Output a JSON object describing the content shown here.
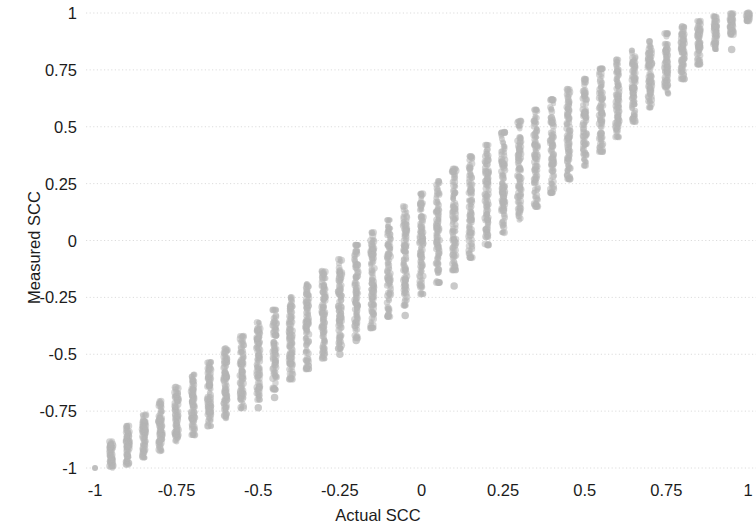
{
  "chart_data": {
    "type": "scatter",
    "title": "",
    "xlabel": "Actual SCC",
    "ylabel": "Measured SCC",
    "xlim": [
      -1.0,
      1.0
    ],
    "ylim": [
      -1.0,
      1.0
    ],
    "grid": true,
    "grid_axis": "y",
    "legend": "none",
    "xticks": [
      -1,
      -0.75,
      -0.5,
      -0.25,
      0,
      0.25,
      0.5,
      0.75,
      1
    ],
    "xticklabels": [
      "-1",
      "-0.75",
      "-0.5",
      "-0.25",
      "0",
      "0.25",
      "0.5",
      "0.75",
      "1"
    ],
    "yticks": [
      -1,
      -0.75,
      -0.5,
      -0.25,
      0,
      0.25,
      0.5,
      0.75,
      1
    ],
    "yticklabels": [
      "-1",
      "-0.75",
      "-0.5",
      "-0.25",
      "0",
      "0.25",
      "0.5",
      "0.75",
      "1"
    ],
    "marker": {
      "shape": "circle",
      "color": "#b4b4b4",
      "size_px": 3.0,
      "opacity": 0.55
    },
    "series": [
      {
        "name": "Measured vs Actual SCC",
        "columns": [
          {
            "x": -1.0,
            "n": 1,
            "center": -1.0,
            "lo": -1.0,
            "hi": -1.0
          },
          {
            "x": -0.95,
            "n": 60,
            "center": -0.94,
            "lo": -1.0,
            "hi": -0.875
          },
          {
            "x": -0.9,
            "n": 70,
            "center": -0.9,
            "lo": -0.985,
            "hi": -0.815
          },
          {
            "x": -0.85,
            "n": 75,
            "center": -0.855,
            "lo": -0.955,
            "hi": -0.765
          },
          {
            "x": -0.8,
            "n": 80,
            "center": -0.81,
            "lo": -0.925,
            "hi": -0.705
          },
          {
            "x": -0.75,
            "n": 85,
            "center": -0.76,
            "lo": -0.885,
            "hi": -0.645
          },
          {
            "x": -0.7,
            "n": 90,
            "center": -0.715,
            "lo": -0.855,
            "hi": -0.59
          },
          {
            "x": -0.65,
            "n": 92,
            "center": -0.665,
            "lo": -0.815,
            "hi": -0.535
          },
          {
            "x": -0.6,
            "n": 95,
            "center": -0.615,
            "lo": -0.78,
            "hi": -0.475
          },
          {
            "x": -0.55,
            "n": 97,
            "center": -0.565,
            "lo": -0.74,
            "hi": -0.42
          },
          {
            "x": -0.5,
            "n": 100,
            "center": -0.515,
            "lo": -0.7,
            "hi": -0.36
          },
          {
            "x": -0.45,
            "n": 100,
            "center": -0.465,
            "lo": -0.655,
            "hi": -0.305
          },
          {
            "x": -0.4,
            "n": 102,
            "center": -0.415,
            "lo": -0.61,
            "hi": -0.25
          },
          {
            "x": -0.35,
            "n": 104,
            "center": -0.365,
            "lo": -0.565,
            "hi": -0.19
          },
          {
            "x": -0.3,
            "n": 105,
            "center": -0.315,
            "lo": -0.52,
            "hi": -0.135
          },
          {
            "x": -0.25,
            "n": 106,
            "center": -0.265,
            "lo": -0.475,
            "hi": -0.08
          },
          {
            "x": -0.2,
            "n": 107,
            "center": -0.215,
            "lo": -0.43,
            "hi": -0.02
          },
          {
            "x": -0.15,
            "n": 108,
            "center": -0.165,
            "lo": -0.385,
            "hi": 0.035
          },
          {
            "x": -0.1,
            "n": 108,
            "center": -0.115,
            "lo": -0.335,
            "hi": 0.09
          },
          {
            "x": -0.05,
            "n": 108,
            "center": -0.06,
            "lo": -0.285,
            "hi": 0.15
          },
          {
            "x": 0.0,
            "n": 108,
            "center": -0.01,
            "lo": -0.235,
            "hi": 0.205
          },
          {
            "x": 0.05,
            "n": 108,
            "center": 0.04,
            "lo": -0.185,
            "hi": 0.26
          },
          {
            "x": 0.1,
            "n": 107,
            "center": 0.09,
            "lo": -0.13,
            "hi": 0.315
          },
          {
            "x": 0.15,
            "n": 106,
            "center": 0.14,
            "lo": -0.075,
            "hi": 0.37
          },
          {
            "x": 0.2,
            "n": 105,
            "center": 0.19,
            "lo": -0.02,
            "hi": 0.42
          },
          {
            "x": 0.25,
            "n": 104,
            "center": 0.24,
            "lo": 0.035,
            "hi": 0.475
          },
          {
            "x": 0.3,
            "n": 102,
            "center": 0.29,
            "lo": 0.09,
            "hi": 0.525
          },
          {
            "x": 0.35,
            "n": 100,
            "center": 0.34,
            "lo": 0.15,
            "hi": 0.575
          },
          {
            "x": 0.4,
            "n": 98,
            "center": 0.39,
            "lo": 0.21,
            "hi": 0.62
          },
          {
            "x": 0.45,
            "n": 96,
            "center": 0.44,
            "lo": 0.27,
            "hi": 0.665
          },
          {
            "x": 0.5,
            "n": 94,
            "center": 0.49,
            "lo": 0.33,
            "hi": 0.71
          },
          {
            "x": 0.55,
            "n": 92,
            "center": 0.54,
            "lo": 0.39,
            "hi": 0.755
          },
          {
            "x": 0.6,
            "n": 90,
            "center": 0.59,
            "lo": 0.455,
            "hi": 0.795
          },
          {
            "x": 0.65,
            "n": 88,
            "center": 0.645,
            "lo": 0.52,
            "hi": 0.835
          },
          {
            "x": 0.7,
            "n": 85,
            "center": 0.695,
            "lo": 0.585,
            "hi": 0.875
          },
          {
            "x": 0.75,
            "n": 82,
            "center": 0.745,
            "lo": 0.645,
            "hi": 0.91
          },
          {
            "x": 0.8,
            "n": 78,
            "center": 0.795,
            "lo": 0.71,
            "hi": 0.94
          },
          {
            "x": 0.85,
            "n": 72,
            "center": 0.85,
            "lo": 0.775,
            "hi": 0.965
          },
          {
            "x": 0.9,
            "n": 64,
            "center": 0.9,
            "lo": 0.84,
            "hi": 0.985
          },
          {
            "x": 0.95,
            "n": 52,
            "center": 0.95,
            "lo": 0.905,
            "hi": 0.998
          },
          {
            "x": 1.0,
            "n": 30,
            "center": 0.99,
            "lo": 0.965,
            "hi": 1.0
          }
        ],
        "outliers": [
          {
            "x": -0.5,
            "y": -0.735
          },
          {
            "x": -0.45,
            "y": -0.69
          },
          {
            "x": -0.25,
            "y": -0.5
          },
          {
            "x": -0.2,
            "y": -0.44
          },
          {
            "x": -0.05,
            "y": -0.33
          },
          {
            "x": 0.1,
            "y": -0.2
          },
          {
            "x": 0.2,
            "y": 0.05
          },
          {
            "x": 0.25,
            "y": 0.17
          },
          {
            "x": 0.3,
            "y": 0.24
          },
          {
            "x": 0.35,
            "y": 0.325
          },
          {
            "x": 0.55,
            "y": 0.47
          },
          {
            "x": 0.6,
            "y": 0.52
          },
          {
            "x": 0.95,
            "y": 0.84
          }
        ]
      }
    ]
  }
}
